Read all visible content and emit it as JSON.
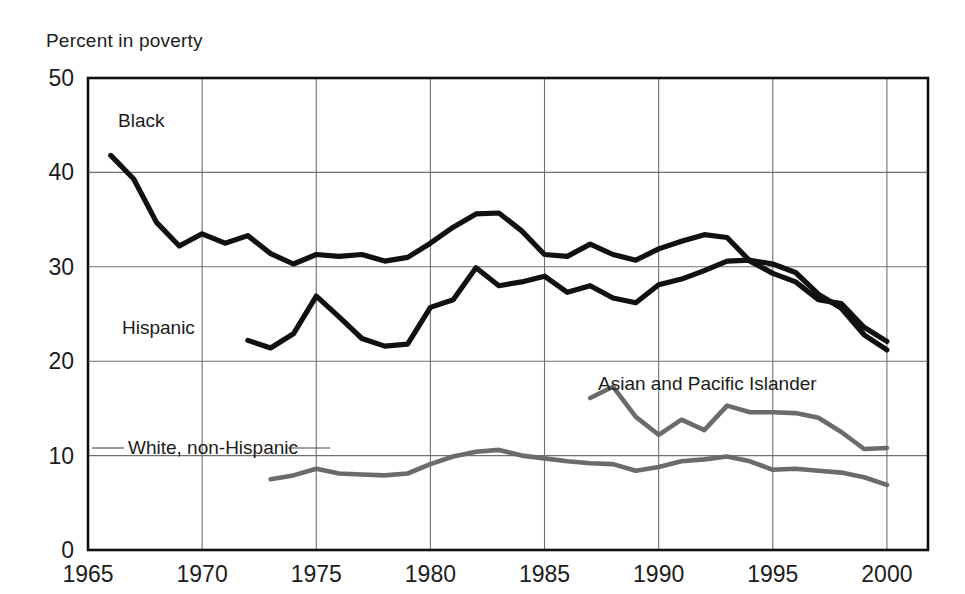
{
  "chart_data": {
    "type": "line",
    "title": "",
    "ylabel": "Percent in poverty",
    "xlabel": "",
    "xlim": [
      1965,
      2001.8
    ],
    "ylim": [
      0,
      50
    ],
    "grid": true,
    "legend_position": "inline-labels",
    "yticks": [
      "0",
      "10",
      "20",
      "30",
      "40",
      "50"
    ],
    "ytick_values": [
      0,
      10,
      20,
      30,
      40,
      50
    ],
    "xticks": [
      "1965",
      "1970",
      "1975",
      "1980",
      "1985",
      "1990",
      "1995",
      "2000"
    ],
    "xtick_values": [
      1965,
      1970,
      1975,
      1980,
      1985,
      1990,
      1995,
      2000
    ],
    "series": [
      {
        "name": "Black",
        "color": "#111111",
        "label": "Black",
        "x": [
          1966,
          1967,
          1968,
          1969,
          1970,
          1971,
          1972,
          1973,
          1974,
          1975,
          1976,
          1977,
          1978,
          1979,
          1980,
          1981,
          1982,
          1983,
          1984,
          1985,
          1986,
          1987,
          1988,
          1989,
          1990,
          1991,
          1992,
          1993,
          1994,
          1995,
          1996,
          1997,
          1998,
          1999,
          2000
        ],
        "values": [
          41.8,
          39.3,
          34.7,
          32.2,
          33.5,
          32.5,
          33.3,
          31.4,
          30.3,
          31.3,
          31.1,
          31.3,
          30.6,
          31.0,
          32.5,
          34.2,
          35.6,
          35.7,
          33.8,
          31.3,
          31.1,
          32.4,
          31.3,
          30.7,
          31.9,
          32.7,
          33.4,
          33.1,
          30.6,
          29.3,
          28.4,
          26.5,
          26.1,
          23.6,
          22.1
        ]
      },
      {
        "name": "Hispanic",
        "color": "#111111",
        "label": "Hispanic",
        "x": [
          1972,
          1973,
          1974,
          1975,
          1976,
          1977,
          1978,
          1979,
          1980,
          1981,
          1982,
          1983,
          1984,
          1985,
          1986,
          1987,
          1988,
          1989,
          1990,
          1991,
          1992,
          1993,
          1994,
          1995,
          1996,
          1997,
          1998,
          1999,
          2000
        ],
        "values": [
          22.2,
          21.4,
          22.9,
          26.9,
          24.7,
          22.4,
          21.6,
          21.8,
          25.7,
          26.5,
          29.9,
          28.0,
          28.4,
          29.0,
          27.3,
          28.0,
          26.7,
          26.2,
          28.1,
          28.7,
          29.6,
          30.6,
          30.7,
          30.3,
          29.4,
          27.1,
          25.6,
          22.8,
          21.2
        ]
      },
      {
        "name": "Asian and Pacific Islander",
        "color": "#6b6b6b",
        "label": "Asian and Pacific Islander",
        "x": [
          1987,
          1988,
          1989,
          1990,
          1991,
          1992,
          1993,
          1994,
          1995,
          1996,
          1997,
          1998,
          1999,
          2000
        ],
        "values": [
          16.1,
          17.3,
          14.1,
          12.2,
          13.8,
          12.7,
          15.3,
          14.6,
          14.6,
          14.5,
          14.0,
          12.5,
          10.7,
          10.8
        ]
      },
      {
        "name": "White, non-Hispanic",
        "color": "#6b6b6b",
        "label": "White, non-Hispanic",
        "x": [
          1973,
          1974,
          1975,
          1976,
          1977,
          1978,
          1979,
          1980,
          1981,
          1982,
          1983,
          1984,
          1985,
          1986,
          1987,
          1988,
          1989,
          1990,
          1991,
          1992,
          1993,
          1994,
          1995,
          1996,
          1997,
          1998,
          1999,
          2000
        ],
        "values": [
          7.5,
          7.9,
          8.6,
          8.1,
          8.0,
          7.9,
          8.1,
          9.1,
          9.9,
          10.4,
          10.6,
          10.0,
          9.7,
          9.4,
          9.2,
          9.1,
          8.4,
          8.8,
          9.4,
          9.6,
          9.9,
          9.4,
          8.5,
          8.6,
          8.4,
          8.2,
          7.7,
          6.9
        ]
      }
    ]
  }
}
